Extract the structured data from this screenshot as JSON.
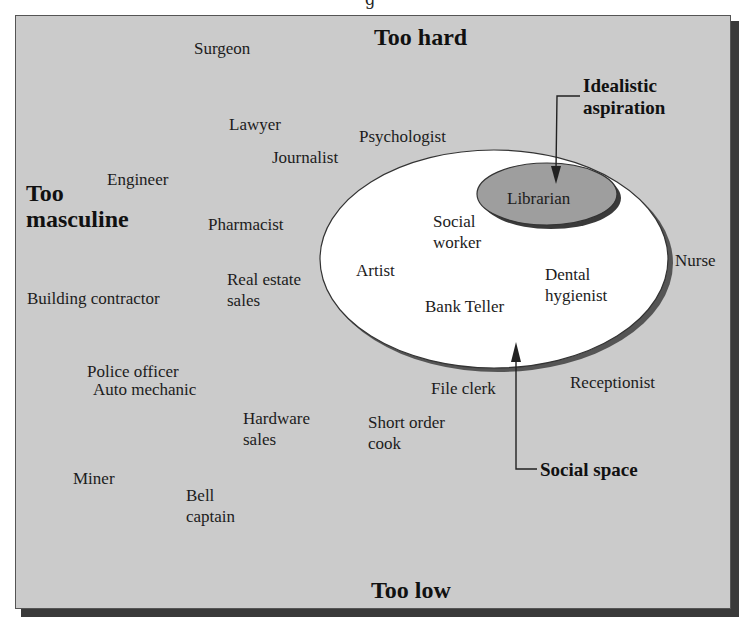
{
  "caption_cutoff": "g",
  "axes": {
    "top": "Too hard",
    "bottom": "Too low",
    "left": "Too\nmasculine"
  },
  "regions": {
    "social_space": {
      "label": "Social space",
      "fill": "#ffffff",
      "occupations": [
        "Social\nworker",
        "Artist",
        "Dental\nhygienist",
        "Bank Teller"
      ]
    },
    "idealistic_aspiration": {
      "label": "Idealistic\naspiration",
      "fill": "#9e9e9e",
      "occupations": [
        "Librarian"
      ]
    }
  },
  "occupations": {
    "surgeon": "Surgeon",
    "lawyer": "Lawyer",
    "psychologist": "Psychologist",
    "journalist": "Journalist",
    "engineer": "Engineer",
    "pharmacist": "Pharmacist",
    "real_estate": "Real estate\nsales",
    "building_contractor": "Building contractor",
    "nurse": "Nurse",
    "police_officer": "Police officer",
    "auto_mechanic": "Auto mechanic",
    "file_clerk": "File clerk",
    "receptionist": "Receptionist",
    "hardware_sales": "Hardware\nsales",
    "short_order_cook": "Short order\ncook",
    "miner": "Miner",
    "bell_captain": "Bell\ncaptain",
    "librarian": "Librarian",
    "social_worker": "Social\nworker",
    "artist": "Artist",
    "dental_hygienist": "Dental\nhygienist",
    "bank_teller": "Bank Teller"
  },
  "colors": {
    "background": "#cbcbcb",
    "shadow": "#3a3a3a",
    "social_space_fill": "#ffffff",
    "aspiration_fill": "#9e9e9e"
  }
}
